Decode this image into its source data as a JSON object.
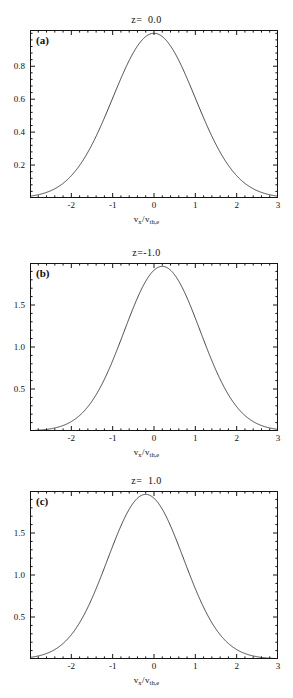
{
  "figure": {
    "background": "#ffffff",
    "line_color": "#303030",
    "axis_color": "#141414",
    "axis_caption_html": "v_x/v_th,e"
  },
  "axis": {
    "x_label_main": "v",
    "x_label_sub": "x",
    "x_label_den": "v",
    "x_label_den_sub": "th,e",
    "x_ticks": [
      "-2",
      "-1",
      "0",
      "1",
      "2",
      "3"
    ],
    "x_tick_values": [
      -2,
      -1,
      0,
      1,
      2,
      3
    ],
    "xlim": [
      -3.0,
      3.0
    ]
  },
  "panels": [
    {
      "letter": "(a)",
      "title": "z=  0.0",
      "y_ticks": [
        "0.2",
        "0.4",
        "0.6",
        "0.8"
      ],
      "y_tick_values": [
        0.2,
        0.4,
        0.6,
        0.8
      ],
      "ylim": [
        0.0,
        1.02
      ],
      "peak_value": 1.0,
      "peak_center": 0.0,
      "sigma": 1.0
    },
    {
      "letter": "(b)",
      "title": "z=-1.0",
      "y_ticks": [
        "0.5",
        "1.0",
        "1.5"
      ],
      "y_tick_values": [
        0.5,
        1.0,
        1.5
      ],
      "ylim": [
        0.0,
        2.0
      ],
      "peak_value": 1.96,
      "peak_center": 0.2,
      "sigma": 0.92
    },
    {
      "letter": "(c)",
      "title": "z=  1.0",
      "y_ticks": [
        "0.5",
        "1.0",
        "1.5"
      ],
      "y_tick_values": [
        0.5,
        1.0,
        1.5
      ],
      "ylim": [
        0.0,
        2.0
      ],
      "peak_value": 1.96,
      "peak_center": -0.2,
      "sigma": 0.92
    }
  ],
  "chart_data": {
    "type": "line",
    "xlabel": "v_x/v_th,e",
    "ylabel": "",
    "xlim": [
      -3.0,
      3.0
    ],
    "grid": false,
    "legend": "none",
    "subplots": [
      {
        "label": "(a)",
        "title": "z=  0.0",
        "ylim": [
          0.0,
          1.02
        ],
        "xticks": [
          -2,
          -1,
          0,
          1,
          2,
          3
        ],
        "yticks": [
          0.2,
          0.4,
          0.6,
          0.8
        ],
        "model": "gaussian",
        "amplitude": 1.0,
        "mean": 0.0,
        "sigma": 1.0,
        "x": [
          -3.0,
          -2.5,
          -2.0,
          -1.5,
          -1.0,
          -0.5,
          0.0,
          0.5,
          1.0,
          1.5,
          2.0,
          2.5,
          3.0
        ],
        "y": [
          0.011,
          0.044,
          0.135,
          0.325,
          0.607,
          0.882,
          1.0,
          0.882,
          0.607,
          0.325,
          0.135,
          0.044,
          0.011
        ]
      },
      {
        "label": "(b)",
        "title": "z=-1.0",
        "ylim": [
          0.0,
          2.0
        ],
        "xticks": [
          -2,
          -1,
          0,
          1,
          2,
          3
        ],
        "yticks": [
          0.5,
          1.0,
          1.5
        ],
        "model": "gaussian",
        "amplitude": 1.96,
        "mean": 0.2,
        "sigma": 0.92,
        "x": [
          -3.0,
          -2.5,
          -2.0,
          -1.5,
          -1.0,
          -0.5,
          0.0,
          0.2,
          0.5,
          1.0,
          1.5,
          2.0,
          2.5,
          3.0
        ],
        "y": [
          0.015,
          0.07,
          0.229,
          0.561,
          1.036,
          1.452,
          1.91,
          1.96,
          1.841,
          1.355,
          0.776,
          0.343,
          0.117,
          0.031
        ]
      },
      {
        "label": "(c)",
        "title": "z=  1.0",
        "ylim": [
          0.0,
          2.0
        ],
        "xticks": [
          -2,
          -1,
          0,
          1,
          2,
          3
        ],
        "yticks": [
          0.5,
          1.0,
          1.5
        ],
        "model": "gaussian",
        "amplitude": 1.96,
        "mean": -0.2,
        "sigma": 0.92,
        "x": [
          -3.0,
          -2.5,
          -2.0,
          -1.5,
          -1.0,
          -0.5,
          -0.2,
          0.0,
          0.5,
          1.0,
          1.5,
          2.0,
          2.5,
          3.0
        ],
        "y": [
          0.031,
          0.117,
          0.343,
          0.776,
          1.355,
          1.841,
          1.96,
          1.91,
          1.452,
          1.036,
          0.561,
          0.229,
          0.07,
          0.015
        ]
      }
    ]
  }
}
